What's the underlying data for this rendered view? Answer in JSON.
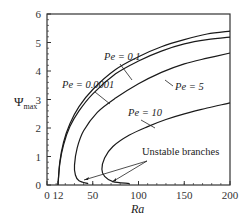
{
  "chart_data": {
    "type": "line",
    "title": "",
    "xlabel": "Ra",
    "ylabel": "Ψmax",
    "xlim": [
      0,
      200
    ],
    "ylim": [
      0,
      6
    ],
    "grid": false,
    "legend": "none (inline annotations)",
    "xticks": [
      "0",
      "12",
      "50",
      "100",
      "150",
      "200"
    ],
    "xtick_values": [
      0,
      12,
      50,
      100,
      150,
      200
    ],
    "yticks": [
      "0",
      "1",
      "2",
      "3",
      "4",
      "5",
      "6"
    ],
    "series": [
      {
        "name": "Pe = 0.0001",
        "x": [
          12,
          14,
          18,
          25,
          35,
          50,
          75,
          100,
          125,
          150,
          175,
          200
        ],
        "y": [
          0,
          0.8,
          1.5,
          2.15,
          2.75,
          3.35,
          4.05,
          4.5,
          4.85,
          5.1,
          5.3,
          5.4
        ]
      },
      {
        "name": "Pe = 0.1",
        "x": [
          12,
          14,
          18,
          25,
          35,
          50,
          75,
          100,
          125,
          150,
          175,
          200
        ],
        "y": [
          0,
          0.75,
          1.4,
          2.05,
          2.6,
          3.2,
          3.9,
          4.35,
          4.7,
          4.95,
          5.1,
          5.19
        ]
      },
      {
        "name": "Pe = 5",
        "x": [
          45,
          35,
          31,
          30,
          33,
          40,
          55,
          75,
          100,
          125,
          150,
          175,
          200
        ],
        "y": [
          0.05,
          0.15,
          0.35,
          0.7,
          1.3,
          1.9,
          2.55,
          3.05,
          3.55,
          3.95,
          4.25,
          4.45,
          4.63
        ],
        "unstable_branch": true
      },
      {
        "name": "Pe = 10",
        "x": [
          90,
          72,
          63,
          60,
          63,
          72,
          90,
          110,
          130,
          150,
          175,
          200
        ],
        "y": [
          0.05,
          0.12,
          0.3,
          0.55,
          0.95,
          1.35,
          1.75,
          2.05,
          2.3,
          2.5,
          2.7,
          2.88
        ],
        "unstable_branch": true
      }
    ],
    "annotations": [
      {
        "text": "Pe = 0.1",
        "x": 70,
        "y": 4.6
      },
      {
        "text": "Pe = 0.0001",
        "x": 25,
        "y": 3.95
      },
      {
        "text": "Pe = 5",
        "x": 148,
        "y": 3.6
      },
      {
        "text": "Pe = 10",
        "x": 115,
        "y": 2.3
      },
      {
        "text": "Unstable branches",
        "x": 130,
        "y": 1.1
      }
    ]
  },
  "labels": {
    "xlabel_prefix": "Ra",
    "ylabel_main": "Ψ",
    "ylabel_sub": "max",
    "pe01": "Pe = 0.1",
    "pe0001": "Pe = 0.0001",
    "pe5": "Pe = 5",
    "pe10": "Pe = 10",
    "unstable": "Unstable branches"
  },
  "style": {
    "line_color": "#1a1a1a",
    "axis_color": "#333333"
  }
}
